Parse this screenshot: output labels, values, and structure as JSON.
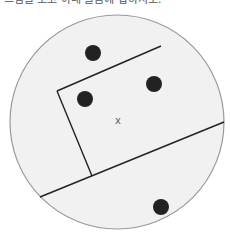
{
  "caption": "그림을 보고 아래 물음에 답하시오.",
  "diagram": {
    "circle": {
      "cx": 117,
      "cy": 122,
      "r": 107,
      "fill": "#f1f1f1",
      "stroke": "#999999"
    },
    "center_mark": {
      "label": "x",
      "x": 118,
      "y": 124
    },
    "lines": [
      {
        "name": "top-edge",
        "x1": 57,
        "y1": 91,
        "x2": 161,
        "y2": 46
      },
      {
        "name": "left-edge",
        "x1": 57,
        "y1": 91,
        "x2": 92,
        "y2": 176
      },
      {
        "name": "long-line",
        "x1": 40,
        "y1": 197,
        "x2": 224,
        "y2": 122
      }
    ],
    "dots": [
      {
        "cx": 93,
        "cy": 53,
        "r": 8
      },
      {
        "cx": 154,
        "cy": 84,
        "r": 8
      },
      {
        "cx": 85,
        "cy": 99,
        "r": 8
      },
      {
        "cx": 161,
        "cy": 207,
        "r": 8
      }
    ],
    "colors": {
      "line": "#222222",
      "dot": "#222222",
      "mark": "#666666"
    }
  }
}
